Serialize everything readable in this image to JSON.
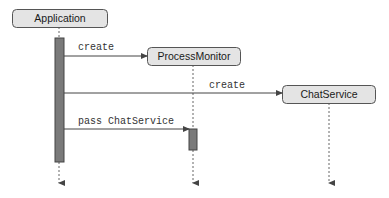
{
  "diagram": {
    "type": "sequence",
    "colors": {
      "actor_fill": "#e4e4e4",
      "actor_stroke": "#555555",
      "activation_fill": "#7a7a7a",
      "line": "#444444",
      "lifeline": "#666666"
    },
    "actors": [
      {
        "id": "application",
        "label": "Application"
      },
      {
        "id": "processmonitor",
        "label": "ProcessMonitor"
      },
      {
        "id": "chatservice",
        "label": "ChatService"
      }
    ],
    "messages": [
      {
        "from": "application",
        "to": "processmonitor",
        "label": "create"
      },
      {
        "from": "application",
        "to": "chatservice",
        "label": "create"
      },
      {
        "from": "application",
        "to": "processmonitor",
        "label": "pass ChatService"
      }
    ]
  }
}
